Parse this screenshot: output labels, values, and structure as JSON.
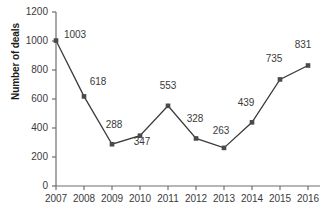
{
  "chart_data": {
    "type": "line",
    "title": "",
    "xlabel": "",
    "ylabel": "Number of deals",
    "categories": [
      "2007",
      "2008",
      "2009",
      "2010",
      "2011",
      "2012",
      "2013",
      "2014",
      "2015",
      "2016"
    ],
    "values": [
      1003,
      618,
      288,
      347,
      553,
      328,
      263,
      439,
      735,
      831
    ],
    "point_labels": [
      "1003",
      "618",
      "288",
      "347",
      "553",
      "328",
      "263",
      "439",
      "735",
      "831"
    ],
    "ylim": [
      0,
      1200
    ],
    "yticks": [
      0,
      200,
      400,
      600,
      800,
      1000,
      1200
    ],
    "ytick_labels": [
      "0",
      "200",
      "400",
      "600",
      "800",
      "1000",
      "1200"
    ],
    "grid": false,
    "legend": false,
    "legend_position": "none",
    "series_color": "#3a3a3a",
    "marker": "square",
    "marker_color": "#4a4a4a",
    "axis_color": "#6e6e6e",
    "text_color": "#3a3a3a"
  }
}
